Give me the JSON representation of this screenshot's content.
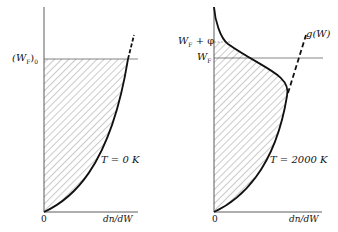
{
  "panels": [
    {
      "id": "left",
      "y_label": "(W_F)_0",
      "y_label_main": "(W",
      "y_label_sub": "F",
      "y_label_close": ")",
      "y_label_sub2": "0",
      "temperature_label": "T = 0 K",
      "origin_label": "0",
      "x_label": "dn/dW"
    },
    {
      "id": "right",
      "y_label_upper": "W_F + φ",
      "y_label_upper_main": "W",
      "y_label_upper_sub": "F",
      "y_label_upper_tail": " + φ",
      "y_label_lower_main": "W",
      "y_label_lower_sub": "F",
      "temperature_label": "T = 2000 K",
      "origin_label": "0",
      "x_label": "dn/dW",
      "curve_label": "g(W)"
    }
  ],
  "colors": {
    "ink": "#111111",
    "hatch": "#555555"
  }
}
